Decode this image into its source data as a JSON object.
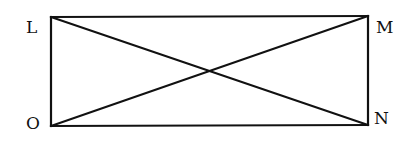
{
  "diagram": {
    "type": "rectangle-with-diagonals",
    "stroke_color": "#111111",
    "background_color": "#ffffff",
    "vertices": [
      {
        "id": "L",
        "label": "L",
        "x": 51,
        "y": 17,
        "label_x": 26,
        "label_y": 33
      },
      {
        "id": "M",
        "label": "M",
        "x": 368,
        "y": 16,
        "label_x": 376,
        "label_y": 33
      },
      {
        "id": "N",
        "label": "N",
        "x": 368,
        "y": 125,
        "label_x": 374,
        "label_y": 124
      },
      {
        "id": "O",
        "label": "O",
        "x": 51,
        "y": 126,
        "label_x": 26,
        "label_y": 129
      }
    ],
    "sides": [
      {
        "from": "L",
        "to": "M"
      },
      {
        "from": "M",
        "to": "N"
      },
      {
        "from": "N",
        "to": "O"
      },
      {
        "from": "O",
        "to": "L"
      }
    ],
    "diagonals": [
      {
        "from": "L",
        "to": "N"
      },
      {
        "from": "O",
        "to": "M"
      }
    ],
    "intersection": {
      "x": 209,
      "y": 71
    }
  }
}
